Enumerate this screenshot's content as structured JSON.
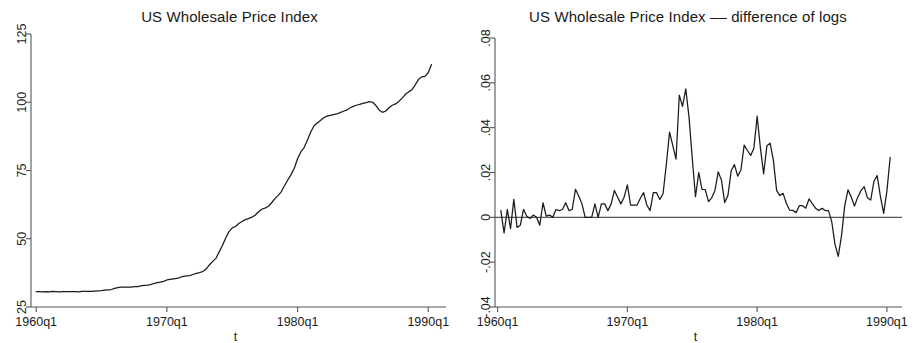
{
  "figure": {
    "background_color": "#ffffff",
    "line_color": "#1a1a1a",
    "axis_color": "#555555"
  },
  "panels": {
    "left": {
      "title": "US Wholesale Price Index",
      "xlabel": "t",
      "yticks": [
        "25",
        "50",
        "75",
        "100",
        "125"
      ],
      "xticks": [
        "1960q1",
        "1970q1",
        "1980q1",
        "1990q1"
      ]
    },
    "right": {
      "title": "US Wholesale Price Index –– difference of logs",
      "xlabel": "t",
      "yticks": [
        "-.04",
        "-.02",
        "0",
        ".02",
        ".04",
        ".06",
        ".08"
      ],
      "xticks": [
        "1960q1",
        "1970q1",
        "1980q1",
        "1990q1"
      ]
    }
  },
  "chart_data": [
    {
      "type": "line",
      "panel": "left",
      "title": "US Wholesale Price Index",
      "xlabel": "t",
      "ylabel": "",
      "xlim": [
        "1960q1",
        "1990q2"
      ],
      "ylim": [
        25,
        125
      ],
      "ytick_values": [
        25,
        50,
        75,
        100,
        125
      ],
      "xtick_labels": [
        "1960q1",
        "1970q1",
        "1980q1",
        "1990q1"
      ],
      "xtick_values": [
        1960.0,
        1970.0,
        1980.0,
        1990.0
      ],
      "grid": false,
      "legend": null,
      "x": [
        1960.0,
        1960.25,
        1960.5,
        1960.75,
        1961.0,
        1961.25,
        1961.5,
        1961.75,
        1962.0,
        1962.25,
        1962.5,
        1962.75,
        1963.0,
        1963.25,
        1963.5,
        1963.75,
        1964.0,
        1964.25,
        1964.5,
        1964.75,
        1965.0,
        1965.25,
        1965.5,
        1965.75,
        1966.0,
        1966.25,
        1966.5,
        1966.75,
        1967.0,
        1967.25,
        1967.5,
        1967.75,
        1968.0,
        1968.25,
        1968.5,
        1968.75,
        1969.0,
        1969.25,
        1969.5,
        1969.75,
        1970.0,
        1970.25,
        1970.5,
        1970.75,
        1971.0,
        1971.25,
        1971.5,
        1971.75,
        1972.0,
        1972.25,
        1972.5,
        1972.75,
        1973.0,
        1973.25,
        1973.5,
        1973.75,
        1974.0,
        1974.25,
        1974.5,
        1974.75,
        1975.0,
        1975.25,
        1975.5,
        1975.75,
        1976.0,
        1976.25,
        1976.5,
        1976.75,
        1977.0,
        1977.25,
        1977.5,
        1977.75,
        1978.0,
        1978.25,
        1978.5,
        1978.75,
        1979.0,
        1979.25,
        1979.5,
        1979.75,
        1980.0,
        1980.25,
        1980.5,
        1980.75,
        1981.0,
        1981.25,
        1981.5,
        1981.75,
        1982.0,
        1982.25,
        1982.5,
        1982.75,
        1983.0,
        1983.25,
        1983.5,
        1983.75,
        1984.0,
        1984.25,
        1984.5,
        1984.75,
        1985.0,
        1985.25,
        1985.5,
        1985.75,
        1986.0,
        1986.25,
        1986.5,
        1986.75,
        1987.0,
        1987.25,
        1987.5,
        1987.75,
        1988.0,
        1988.25,
        1988.5,
        1988.75,
        1989.0,
        1989.25,
        1989.5,
        1989.75,
        1990.0,
        1990.25
      ],
      "values": [
        30.6,
        30.6,
        30.5,
        30.6,
        30.5,
        30.7,
        30.6,
        30.5,
        30.6,
        30.6,
        30.6,
        30.6,
        30.6,
        30.5,
        30.7,
        30.7,
        30.7,
        30.7,
        30.8,
        30.9,
        31.0,
        31.2,
        31.3,
        31.4,
        31.8,
        32.1,
        32.3,
        32.3,
        32.3,
        32.3,
        32.5,
        32.5,
        32.7,
        32.9,
        33.0,
        33.2,
        33.6,
        33.9,
        34.1,
        34.4,
        34.9,
        35.1,
        35.3,
        35.5,
        35.8,
        36.2,
        36.4,
        36.5,
        36.9,
        37.3,
        37.6,
        38.0,
        38.9,
        40.4,
        41.7,
        42.8,
        45.2,
        47.5,
        50.3,
        52.6,
        54.0,
        54.5,
        55.6,
        56.3,
        57.0,
        57.4,
        57.9,
        58.6,
        59.8,
        60.8,
        61.2,
        61.8,
        63.1,
        64.6,
        65.8,
        67.2,
        69.4,
        71.5,
        73.5,
        75.8,
        79.3,
        81.8,
        83.4,
        86.1,
        89.0,
        91.3,
        92.4,
        93.3,
        94.3,
        94.9,
        95.2,
        95.5,
        95.7,
        96.2,
        96.7,
        97.1,
        97.9,
        98.5,
        98.9,
        99.2,
        99.6,
        99.9,
        100.2,
        100.0,
        98.8,
        97.1,
        96.3,
        96.8,
        98.0,
        98.9,
        99.4,
        100.3,
        101.5,
        102.9,
        103.8,
        104.6,
        106.3,
        108.3,
        109.3,
        109.5,
        110.8,
        113.8
      ],
      "notes": "Quarterly US wholesale (producer) price index, 1960q1-1990q2; flat near 30-31 through the 1960s, sharp rise during 1973-1981 oil shocks, plateau near 100 in 1982-1985, dip to about 96 in 1986, then rise to about 114-117 by 1990."
    },
    {
      "type": "line",
      "panel": "right",
      "title": "US Wholesale Price Index –– difference of logs",
      "xlabel": "t",
      "ylabel": "",
      "xlim": [
        "1960q1",
        "1990q2"
      ],
      "ylim": [
        -0.04,
        0.08
      ],
      "ytick_values": [
        -0.04,
        -0.02,
        0,
        0.02,
        0.04,
        0.06,
        0.08
      ],
      "xtick_labels": [
        "1960q1",
        "1970q1",
        "1980q1",
        "1990q1"
      ],
      "xtick_values": [
        1960.0,
        1970.0,
        1980.0,
        1990.0
      ],
      "grid": false,
      "zero_line": 0,
      "legend": null,
      "x": [
        1960.25,
        1960.5,
        1960.75,
        1961.0,
        1961.25,
        1961.5,
        1961.75,
        1962.0,
        1962.25,
        1962.5,
        1962.75,
        1963.0,
        1963.25,
        1963.5,
        1963.75,
        1964.0,
        1964.25,
        1964.5,
        1964.75,
        1965.0,
        1965.25,
        1965.5,
        1965.75,
        1966.0,
        1966.25,
        1966.5,
        1966.75,
        1967.0,
        1967.25,
        1967.5,
        1967.75,
        1968.0,
        1968.25,
        1968.5,
        1968.75,
        1969.0,
        1969.25,
        1969.5,
        1969.75,
        1970.0,
        1970.25,
        1970.5,
        1970.75,
        1971.0,
        1971.25,
        1971.5,
        1971.75,
        1972.0,
        1972.25,
        1972.5,
        1972.75,
        1973.0,
        1973.25,
        1973.5,
        1973.75,
        1974.0,
        1974.25,
        1974.5,
        1974.75,
        1975.0,
        1975.25,
        1975.5,
        1975.75,
        1976.0,
        1976.25,
        1976.5,
        1976.75,
        1977.0,
        1977.25,
        1977.5,
        1977.75,
        1978.0,
        1978.25,
        1978.5,
        1978.75,
        1979.0,
        1979.25,
        1979.5,
        1979.75,
        1980.0,
        1980.25,
        1980.5,
        1980.75,
        1981.0,
        1981.25,
        1981.5,
        1981.75,
        1982.0,
        1982.25,
        1982.5,
        1982.75,
        1983.0,
        1983.25,
        1983.5,
        1983.75,
        1984.0,
        1984.25,
        1984.5,
        1984.75,
        1985.0,
        1985.25,
        1985.5,
        1985.75,
        1986.0,
        1986.25,
        1986.5,
        1986.75,
        1987.0,
        1987.25,
        1987.5,
        1987.75,
        1988.0,
        1988.25,
        1988.5,
        1988.75,
        1989.0,
        1989.25,
        1989.5,
        1989.75,
        1990.0,
        1990.25
      ],
      "values": [
        0.003,
        -0.007,
        0.0035,
        -0.005,
        0.008,
        -0.0045,
        -0.0035,
        0.0035,
        0.0005,
        -0.0005,
        0.001,
        0.0,
        -0.0035,
        0.0065,
        0.0005,
        0.001,
        0.0,
        0.0035,
        0.003,
        0.0035,
        0.0065,
        0.003,
        0.0035,
        0.0125,
        0.0095,
        0.006,
        0.0,
        0.0,
        0.0,
        0.006,
        0.0,
        0.006,
        0.006,
        0.003,
        0.006,
        0.012,
        0.009,
        0.006,
        0.009,
        0.0145,
        0.0055,
        0.0055,
        0.0055,
        0.0085,
        0.011,
        0.0055,
        0.003,
        0.011,
        0.011,
        0.008,
        0.0105,
        0.0235,
        0.038,
        0.032,
        0.026,
        0.0545,
        0.0495,
        0.0573,
        0.0447,
        0.0263,
        0.0092,
        0.02,
        0.0125,
        0.0124,
        0.007,
        0.0087,
        0.012,
        0.0203,
        0.0166,
        0.0066,
        0.0098,
        0.0208,
        0.0235,
        0.0184,
        0.0211,
        0.0322,
        0.0298,
        0.0276,
        0.0308,
        0.0451,
        0.031,
        0.0194,
        0.0319,
        0.0331,
        0.0255,
        0.012,
        0.0097,
        0.0107,
        0.0063,
        0.0032,
        0.0031,
        0.0021,
        0.0052,
        0.0052,
        0.0041,
        0.0082,
        0.0061,
        0.0041,
        0.003,
        0.004,
        0.003,
        0.003,
        -0.002,
        -0.0121,
        -0.0174,
        -0.0083,
        0.0052,
        0.0123,
        0.0091,
        0.005,
        0.009,
        0.0119,
        0.0137,
        0.0087,
        0.0077,
        0.0161,
        0.0186,
        0.0092,
        0.0018,
        0.0118,
        0.0267
      ],
      "notes": "First difference of logs of the WPI series. Oscillates near zero through the 1960s, large spikes to about .047 and .069 during 1974 oil shock, second cluster near .045 around 1979-1980, deep trough near -.018 in 1986, and a final rise to about .027 in 1990q2."
    }
  ]
}
